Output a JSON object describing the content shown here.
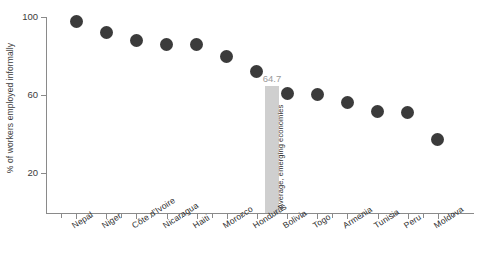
{
  "chart_data": {
    "type": "scatter",
    "title": "",
    "xlabel": "",
    "ylabel": "% of workers employed informally",
    "ylim": [
      0,
      104
    ],
    "yticks": [
      20,
      60,
      100
    ],
    "grid": false,
    "legend": null,
    "categories": [
      "Nepal",
      "Niger",
      "Côte d'Ivoire",
      "Nicaragua",
      "Haiti",
      "Morocco",
      "Honduras",
      "Bolivia",
      "Togo",
      "Armenia",
      "Tunisia",
      "Peru",
      "Moldova"
    ],
    "values": [
      97.5,
      92,
      88,
      86,
      86,
      79.5,
      72,
      61,
      60.5,
      56,
      51.5,
      51,
      37
    ],
    "annotations": [
      {
        "name": "average-emerging-economies",
        "label": "Average, emerging economies",
        "value": 64.7,
        "value_text": "64.7",
        "position_index": 7,
        "color": "#cfcfcf"
      }
    ],
    "series_color": "#3b3b3b"
  },
  "axes": {
    "y_title": "% of workers employed informally",
    "y_tick_labels": [
      "100",
      "60",
      "20"
    ]
  },
  "annotation": {
    "value_text": "64.7",
    "bar_label": "Average, emerging economies"
  }
}
